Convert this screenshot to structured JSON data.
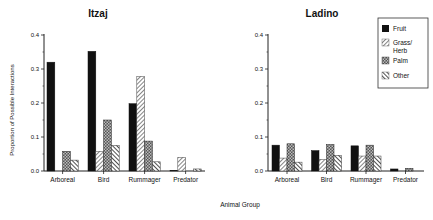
{
  "chart_data": [
    {
      "type": "bar",
      "title": "Itzaj",
      "xlabel": "Animal Group",
      "ylabel": "Proportion of Possible Interactions",
      "ylim": [
        0,
        0.4
      ],
      "yticks": [
        "0.0",
        "0.1",
        "0.2",
        "0.3",
        "0.4"
      ],
      "categories": [
        "Arboreal",
        "Bird",
        "Rummager",
        "Predator"
      ],
      "series": [
        {
          "name": "Fruit",
          "values": [
            0.32,
            0.352,
            0.198,
            0.002
          ]
        },
        {
          "name": "Grass/Herb",
          "values": [
            0.0,
            0.058,
            0.278,
            0.04
          ]
        },
        {
          "name": "Palm",
          "values": [
            0.058,
            0.15,
            0.088,
            0.0
          ]
        },
        {
          "name": "Other",
          "values": [
            0.032,
            0.075,
            0.027,
            0.006
          ]
        }
      ],
      "grid": false
    },
    {
      "type": "bar",
      "title": "Ladino",
      "xlabel": "Animal Group",
      "ylabel": "",
      "ylim": [
        0,
        0.4
      ],
      "yticks": [
        "0.0",
        "0.1",
        "0.2",
        "0.3",
        "0.4"
      ],
      "categories": [
        "Arboreal",
        "Bird",
        "Rummager",
        "Predator"
      ],
      "series": [
        {
          "name": "Fruit",
          "values": [
            0.076,
            0.06,
            0.074,
            0.006
          ]
        },
        {
          "name": "Grass/Herb",
          "values": [
            0.038,
            0.034,
            0.044,
            0.0
          ]
        },
        {
          "name": "Palm",
          "values": [
            0.08,
            0.078,
            0.076,
            0.008
          ]
        },
        {
          "name": "Other",
          "values": [
            0.026,
            0.046,
            0.044,
            0.0
          ]
        }
      ],
      "grid": false
    }
  ],
  "labels": {
    "shared_xlabel": "Animal Group",
    "ylabel": "Proportion of Possible Interactions",
    "left_title": "Itzaj",
    "right_title": "Ladino"
  },
  "legend": {
    "position": "top-right",
    "items": [
      {
        "label_lines": [
          "Fruit"
        ],
        "pattern": "solid-black"
      },
      {
        "label_lines": [
          "Grass/",
          "Herb"
        ],
        "pattern": "light-diagonal-hatch"
      },
      {
        "label_lines": [
          "Palm"
        ],
        "pattern": "dark-crosshatch"
      },
      {
        "label_lines": [
          "Other"
        ],
        "pattern": "back-diagonal-hatch"
      }
    ]
  }
}
